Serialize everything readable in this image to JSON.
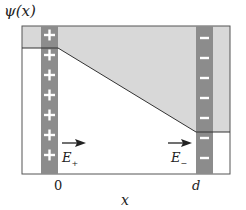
{
  "figure": {
    "y_axis_label": "ψ(x)",
    "x_axis_label": "x",
    "x_ticks": [
      "0",
      "d"
    ],
    "left_plate": {
      "charge_symbol": "+",
      "count": 8,
      "field_label": "E",
      "field_subscript": "+"
    },
    "right_plate": {
      "charge_symbol": "−",
      "count": 8,
      "field_label": "E",
      "field_subscript": "−"
    },
    "colors": {
      "plate": "#8c8c8c",
      "shaded_region": "#d8d8d8",
      "frame": "#555555",
      "potential_line": "#333333",
      "background": "#ffffff"
    }
  }
}
